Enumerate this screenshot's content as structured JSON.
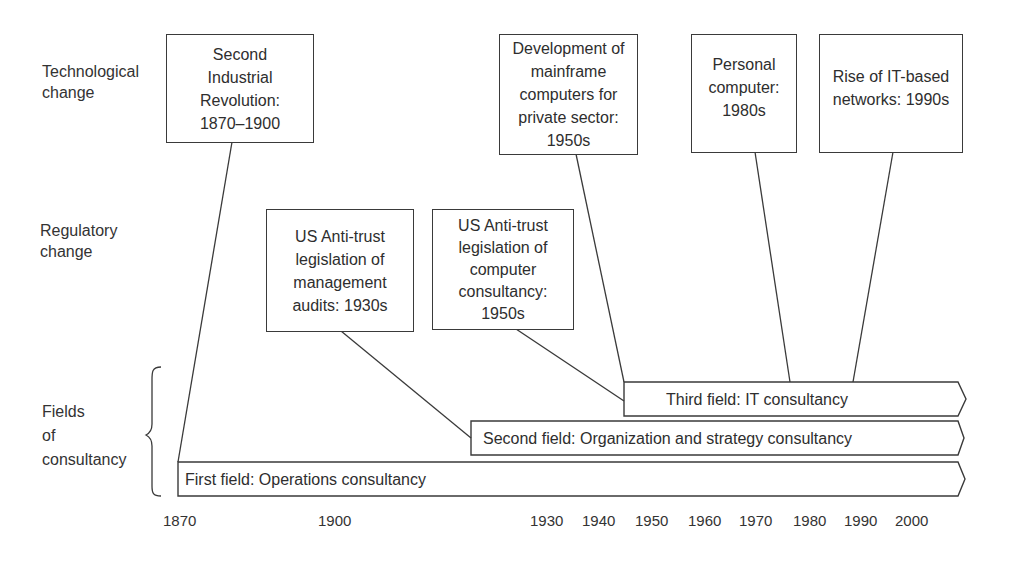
{
  "row_labels": {
    "technological": "Technological\nchange",
    "regulatory": "Regulatory\nchange",
    "fields": "Fields\nof\nconsultancy"
  },
  "technological_events": [
    {
      "text": "Second\nIndustrial\nRevolution:\n1870–1900"
    },
    {
      "text": "Development of\nmainframe\ncomputers for\nprivate sector:\n1950s"
    },
    {
      "text": "Personal\ncomputer:\n1980s"
    },
    {
      "text": "Rise of IT-based\nnetworks: 1990s"
    }
  ],
  "regulatory_events": [
    {
      "text": "US Anti-trust\nlegislation of\nmanagement\naudits: 1930s"
    },
    {
      "text": "US Anti-trust\nlegislation of\ncomputer\nconsultancy:\n1950s"
    }
  ],
  "fields": [
    {
      "label": "Third field: IT consultancy"
    },
    {
      "label": "Second field: Organization and strategy consultancy"
    },
    {
      "label": "First field: Operations consultancy"
    }
  ],
  "axis": {
    "ticks": [
      "1870",
      "1900",
      "1930",
      "1940",
      "1950",
      "1960",
      "1970",
      "1980",
      "1990",
      "2000"
    ]
  },
  "colors": {
    "stroke": "#3a3a3a",
    "text": "#2e2e2e",
    "background": "#ffffff"
  }
}
